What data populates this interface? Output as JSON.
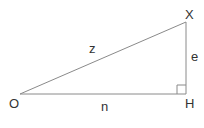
{
  "diagram": {
    "type": "right-triangle",
    "vertices": {
      "O": {
        "label": "O",
        "x": 20,
        "y": 94
      },
      "H": {
        "label": "H",
        "x": 186,
        "y": 94
      },
      "X": {
        "label": "X",
        "x": 186,
        "y": 22
      }
    },
    "sides": {
      "hypotenuse": {
        "label": "z",
        "from": "O",
        "to": "X"
      },
      "base": {
        "label": "n",
        "from": "O",
        "to": "H"
      },
      "height": {
        "label": "e",
        "from": "H",
        "to": "X"
      }
    },
    "right_angle_at": "H",
    "colors": {
      "stroke": "#8a8a8a",
      "text": "#333333"
    }
  }
}
